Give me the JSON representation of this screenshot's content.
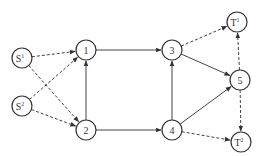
{
  "diagram": {
    "type": "directed-network",
    "nodes": [
      {
        "id": "S1",
        "label": "S",
        "sup": "1",
        "x": 22,
        "y": 58
      },
      {
        "id": "S2",
        "label": "S",
        "sup": "2",
        "x": 22,
        "y": 106
      },
      {
        "id": "n1",
        "label": "1",
        "sup": "",
        "x": 86,
        "y": 50
      },
      {
        "id": "n2",
        "label": "2",
        "sup": "",
        "x": 86,
        "y": 130
      },
      {
        "id": "n3",
        "label": "3",
        "sup": "",
        "x": 172,
        "y": 50
      },
      {
        "id": "n4",
        "label": "4",
        "sup": "",
        "x": 172,
        "y": 130
      },
      {
        "id": "n5",
        "label": "5",
        "sup": "",
        "x": 240,
        "y": 80
      },
      {
        "id": "T1",
        "label": "T",
        "sup": "1",
        "x": 237,
        "y": 22
      },
      {
        "id": "T2",
        "label": "T",
        "sup": "2",
        "x": 241,
        "y": 142
      }
    ],
    "edges": [
      {
        "from": "S1",
        "to": "n1",
        "style": "dashed"
      },
      {
        "from": "S1",
        "to": "n2",
        "style": "dashed"
      },
      {
        "from": "S2",
        "to": "n1",
        "style": "dashed"
      },
      {
        "from": "S2",
        "to": "n2",
        "style": "dashed"
      },
      {
        "from": "n1",
        "to": "n3",
        "style": "solid"
      },
      {
        "from": "n2",
        "to": "n1",
        "style": "solid"
      },
      {
        "from": "n2",
        "to": "n4",
        "style": "solid"
      },
      {
        "from": "n4",
        "to": "n3",
        "style": "solid"
      },
      {
        "from": "n3",
        "to": "n5",
        "style": "solid"
      },
      {
        "from": "n4",
        "to": "n5",
        "style": "solid"
      },
      {
        "from": "n3",
        "to": "T1",
        "style": "dashed"
      },
      {
        "from": "n5",
        "to": "T1",
        "style": "dashed"
      },
      {
        "from": "n5",
        "to": "T2",
        "style": "dashed"
      },
      {
        "from": "n4",
        "to": "T2",
        "style": "dashed"
      }
    ],
    "node_radius": 10,
    "colors": {
      "stroke": "#333333",
      "background": "#ffffff"
    }
  }
}
